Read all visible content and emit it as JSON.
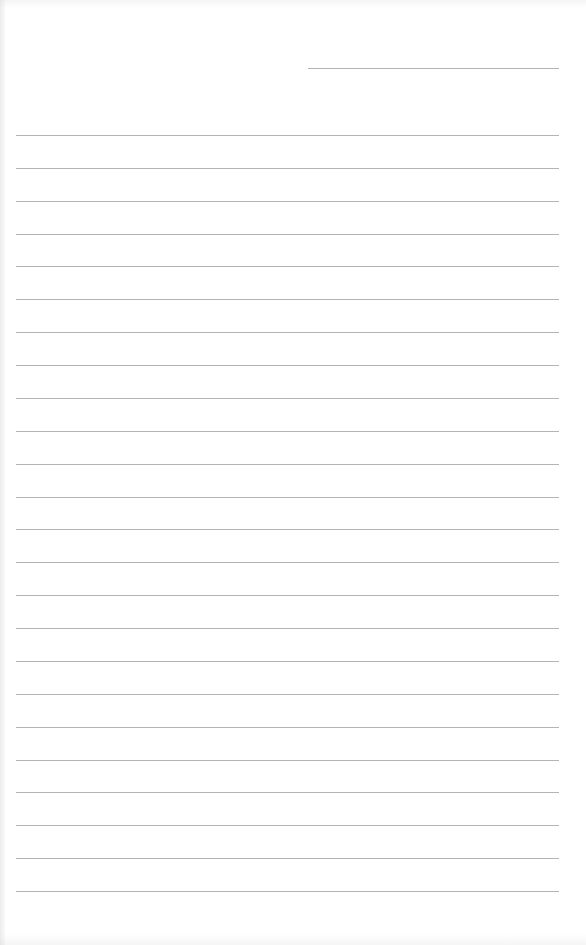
{
  "document": {
    "type": "lined-paper",
    "background_color": "#ffffff",
    "line_color": "#b4b4b4",
    "header_line": {
      "label": "",
      "x_start": 308,
      "x_end": 559,
      "y": 68
    },
    "ruled_lines": {
      "count": 24,
      "x_start": 16,
      "x_end": 559,
      "first_y": 135,
      "spacing": 32.87,
      "contents": [
        "",
        "",
        "",
        "",
        "",
        "",
        "",
        "",
        "",
        "",
        "",
        "",
        "",
        "",
        "",
        "",
        "",
        "",
        "",
        "",
        "",
        "",
        "",
        ""
      ]
    }
  }
}
